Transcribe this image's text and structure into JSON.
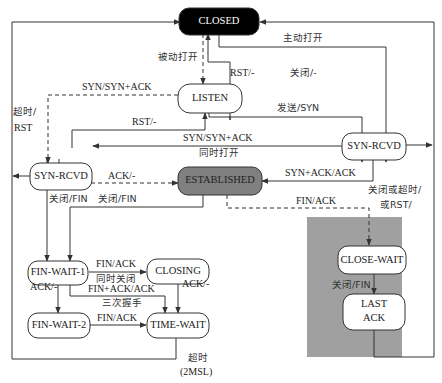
{
  "diagram": {
    "states": {
      "closed": "CLOSED",
      "listen": "LISTEN",
      "syn_rcvd_left": "SYN-RCVD",
      "syn_rcvd_right": "SYN-RCVD",
      "established": "ESTABLISHED",
      "fin_wait_1": "FIN-WAIT-1",
      "closing": "CLOSING",
      "fin_wait_2": "FIN-WAIT-2",
      "time_wait": "TIME-WAIT",
      "close_wait": "CLOSE-WAIT",
      "last_ack_1": "LAST",
      "last_ack_2": "ACK"
    },
    "edges": {
      "passive_open": "被动打开",
      "active_open": "主动打开",
      "syn_syn_ack": "SYN/SYN+ACK",
      "rst_listen_closed": "RST/-",
      "close_listen": "关闭/-",
      "timeout_rst_1": "超时/",
      "timeout_rst_2": "RST",
      "rst_synrcvd_listen": "RST/-",
      "send_syn": "发送/SYN",
      "simul_open_1": "SYN/SYN+ACK",
      "simul_open_2": "同时打开",
      "ack": "ACK/-",
      "syn_ack_ack": "SYN+ACK/ACK",
      "close_fin_1": "关闭/FIN",
      "close_fin_2": "关闭/FIN",
      "close_or_timeout_1": "关闭或超时/",
      "close_or_timeout_2": "或RST/",
      "fin_ack_est": "FIN/ACK",
      "fin_ack_simul_1": "FIN/ACK",
      "fin_ack_simul_2": "同时关闭",
      "ack_fw1_fw2": "ACK/-",
      "fin_ack_ack_1": "FIN+ACK/ACK",
      "fin_ack_ack_2": "三次握手",
      "ack_closing_tw": "ACK/-",
      "fin_ack_fw2_tw": "FIN/ACK",
      "close_fin_cw": "关闭/FIN",
      "timeout_2msl_1": "超时",
      "timeout_2msl_2": "(2MSL)"
    },
    "colors": {
      "closed_fill": "#000000",
      "established_fill": "#808080",
      "passive_close_region": "#a0a0a0",
      "state_fill": "#ffffff",
      "stroke": "#333333"
    }
  }
}
